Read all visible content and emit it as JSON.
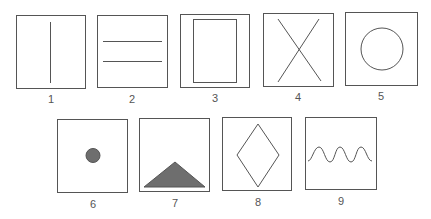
{
  "colors": {
    "stroke": "#555555",
    "fill": "#6e6e6e",
    "background": "#ffffff"
  },
  "panels": [
    {
      "id": 1,
      "label": "1",
      "shape": "vertical-line"
    },
    {
      "id": 2,
      "label": "2",
      "shape": "two-horizontal-lines"
    },
    {
      "id": 3,
      "label": "3",
      "shape": "inner-rectangle"
    },
    {
      "id": 4,
      "label": "4",
      "shape": "x-cross"
    },
    {
      "id": 5,
      "label": "5",
      "shape": "circle"
    },
    {
      "id": 6,
      "label": "6",
      "shape": "filled-dot"
    },
    {
      "id": 7,
      "label": "7",
      "shape": "filled-triangle"
    },
    {
      "id": 8,
      "label": "8",
      "shape": "diamond"
    },
    {
      "id": 9,
      "label": "9",
      "shape": "sine-wave"
    }
  ]
}
